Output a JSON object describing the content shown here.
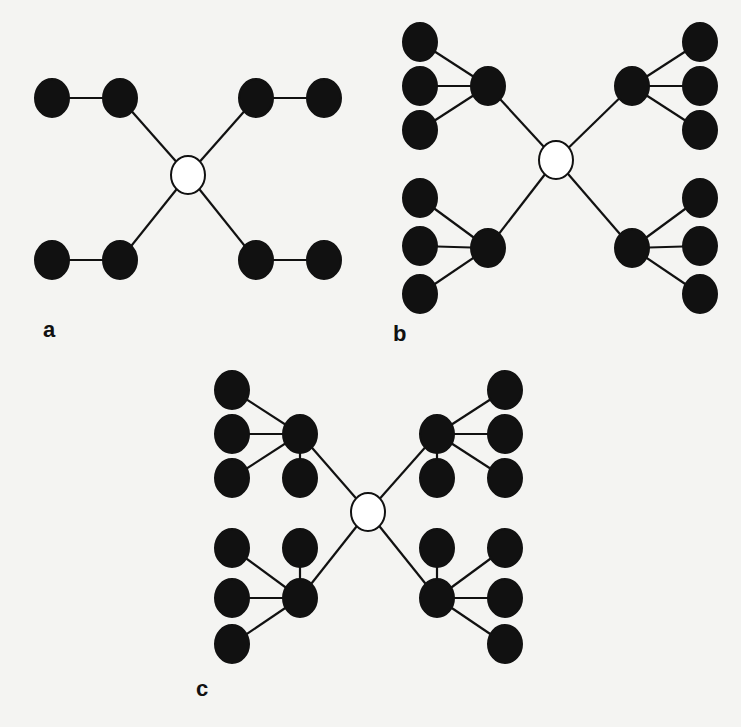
{
  "figure": {
    "style": {
      "background": "#f4f4f2",
      "leaf_fill": "#111111",
      "center_fill": "#ffffff",
      "stroke": "#111111",
      "edge_width": 2.2,
      "node_radius": 17
    },
    "panels": [
      {
        "id": "a",
        "label": "a",
        "label_pos": [
          50,
          331
        ],
        "center": [
          188,
          175
        ],
        "hubs": [
          {
            "pos": [
              120,
              98
            ],
            "leaves": [
              [
                52,
                98
              ]
            ]
          },
          {
            "pos": [
              256,
              98
            ],
            "leaves": [
              [
                324,
                98
              ]
            ]
          },
          {
            "pos": [
              120,
              260
            ],
            "leaves": [
              [
                52,
                260
              ]
            ]
          },
          {
            "pos": [
              256,
              260
            ],
            "leaves": [
              [
                324,
                260
              ]
            ]
          }
        ]
      },
      {
        "id": "b",
        "label": "b",
        "label_pos": [
          400,
          335
        ],
        "center": [
          556,
          160
        ],
        "hubs": [
          {
            "pos": [
              488,
              86
            ],
            "leaves": [
              [
                420,
                42
              ],
              [
                420,
                86
              ],
              [
                420,
                130
              ]
            ]
          },
          {
            "pos": [
              632,
              86
            ],
            "leaves": [
              [
                700,
                42
              ],
              [
                700,
                86
              ],
              [
                700,
                130
              ]
            ]
          },
          {
            "pos": [
              488,
              248
            ],
            "leaves": [
              [
                420,
                198
              ],
              [
                420,
                246
              ],
              [
                420,
                294
              ]
            ]
          },
          {
            "pos": [
              632,
              248
            ],
            "leaves": [
              [
                700,
                198
              ],
              [
                700,
                246
              ],
              [
                700,
                294
              ]
            ]
          }
        ]
      },
      {
        "id": "c",
        "label": "c",
        "label_pos": [
          203,
          690
        ],
        "center": [
          368,
          512
        ],
        "hubs": [
          {
            "pos": [
              300,
              434
            ],
            "leaves": [
              [
                232,
                390
              ],
              [
                232,
                434
              ],
              [
                232,
                478
              ],
              [
                300,
                478
              ]
            ]
          },
          {
            "pos": [
              437,
              434
            ],
            "leaves": [
              [
                505,
                390
              ],
              [
                505,
                434
              ],
              [
                505,
                478
              ],
              [
                437,
                478
              ]
            ]
          },
          {
            "pos": [
              300,
              598
            ],
            "leaves": [
              [
                232,
                548
              ],
              [
                300,
                548
              ],
              [
                232,
                598
              ],
              [
                232,
                644
              ]
            ]
          },
          {
            "pos": [
              437,
              598
            ],
            "leaves": [
              [
                437,
                548
              ],
              [
                505,
                548
              ],
              [
                505,
                598
              ],
              [
                505,
                644
              ]
            ]
          }
        ]
      }
    ]
  }
}
